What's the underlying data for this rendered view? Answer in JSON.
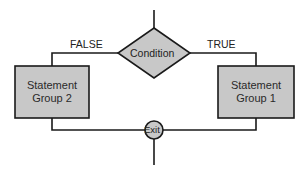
{
  "diagram": {
    "type": "flowchart-if-else",
    "condition": {
      "label": "Condition"
    },
    "branches": {
      "false": {
        "label": "FALSE",
        "target": "Statement Group 2"
      },
      "true": {
        "label": "TRUE",
        "target": "Statement Group 1"
      }
    },
    "boxes": {
      "left": {
        "line1": "Statement",
        "line2": "Group 2"
      },
      "right": {
        "line1": "Statement",
        "line2": "Group 1"
      }
    },
    "exit": {
      "label": "Exit"
    },
    "colors": {
      "fill": "#c8c8c8",
      "stroke": "#1a1a1a",
      "background": "#ffffff"
    }
  }
}
